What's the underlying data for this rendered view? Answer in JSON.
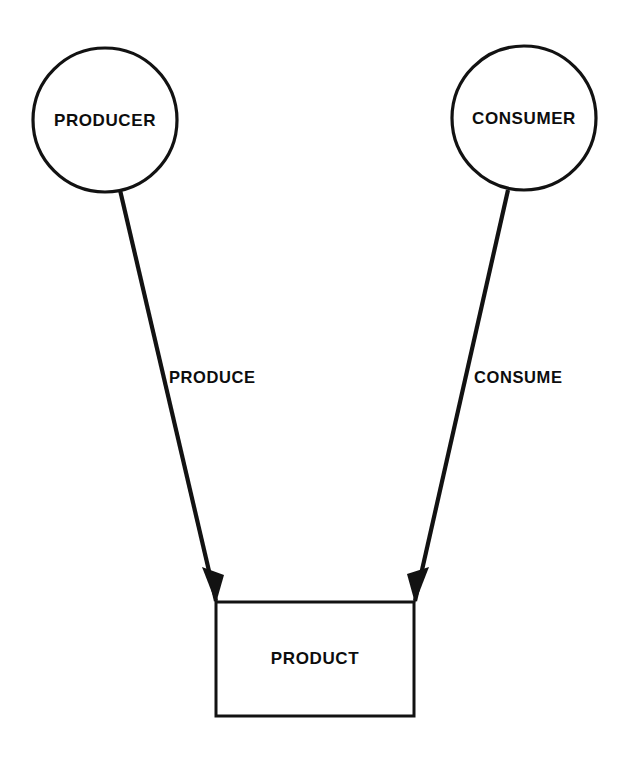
{
  "diagram": {
    "background_color": "#ffffff",
    "line_color": "#121212",
    "text_color": "#0d0d0d",
    "nodes": [
      {
        "id": "producer",
        "label": "PRODUCER",
        "shape": "circle",
        "cx": 105,
        "cy": 120,
        "r": 72
      },
      {
        "id": "consumer",
        "label": "CONSUMER",
        "shape": "circle",
        "cx": 524,
        "cy": 118,
        "r": 72
      },
      {
        "id": "product",
        "label": "PRODUCT",
        "shape": "rectangle",
        "x": 216,
        "y": 602,
        "width": 198,
        "height": 114,
        "label_x": 315,
        "label_y": 660
      }
    ],
    "edges": [
      {
        "id": "produce",
        "label": "PRODUCE",
        "from": "producer",
        "to": "product",
        "x1": 120,
        "y1": 190,
        "x2": 216,
        "y2": 601,
        "label_x": 169,
        "label_y": 379,
        "arrow": "to"
      },
      {
        "id": "consume",
        "label": "CONSUME",
        "from": "consumer",
        "to": "product",
        "x1": 508,
        "y1": 190,
        "x2": 415,
        "y2": 601,
        "label_x": 474,
        "label_y": 379,
        "arrow": "to"
      }
    ]
  }
}
